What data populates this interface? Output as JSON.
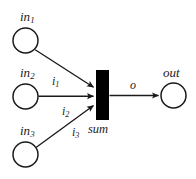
{
  "figure": {
    "kind": "petri-net",
    "background_color": "#ffffff",
    "stroke_color": "#1a1a1a",
    "transition_fill": "#000000"
  },
  "places": [
    {
      "id": "in1",
      "label_base": "in",
      "label_sub": "1",
      "cx": 25.5,
      "cy": 40.5,
      "r": 12.5
    },
    {
      "id": "in2",
      "label_base": "in",
      "label_sub": "2",
      "cx": 25.5,
      "cy": 96.5,
      "r": 12.5
    },
    {
      "id": "in3",
      "label_base": "in",
      "label_sub": "3",
      "cx": 25.5,
      "cy": 154.5,
      "r": 12.5
    },
    {
      "id": "out",
      "label_base": "out",
      "label_sub": "",
      "cx": 173.5,
      "cy": 95.5,
      "r": 12.5
    }
  ],
  "transition": {
    "id": "sum",
    "label": "sum",
    "x": 96,
    "y": 70,
    "width": 13,
    "height": 50
  },
  "arcs": [
    {
      "id": "arc-i1",
      "from": "in1",
      "to": "sum",
      "label_base": "i",
      "label_sub": "1"
    },
    {
      "id": "arc-i2",
      "from": "in2",
      "to": "sum",
      "label_base": "i",
      "label_sub": "2"
    },
    {
      "id": "arc-i3",
      "from": "in3",
      "to": "sum",
      "label_base": "i",
      "label_sub": "3"
    },
    {
      "id": "arc-o",
      "from": "sum",
      "to": "out",
      "label_base": "o",
      "label_sub": ""
    }
  ]
}
